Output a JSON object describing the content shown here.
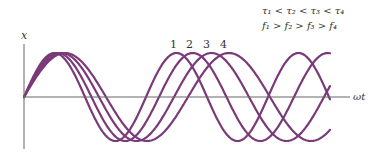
{
  "diagram": {
    "y_axis_label": "x",
    "x_axis_label": "ωt",
    "relations": {
      "tau": "τ₁ < τ₂ < τ₃ < τ₄",
      "freq": "f₁ > f₂ > f₃ > f₄"
    },
    "curves": [
      {
        "label": "1",
        "period_px": 122
      },
      {
        "label": "2",
        "period_px": 135
      },
      {
        "label": "3",
        "period_px": 150
      },
      {
        "label": "4",
        "period_px": 164
      }
    ],
    "colors": {
      "curve": "#7a3a78",
      "axis": "#555555",
      "text": "#333333"
    }
  }
}
